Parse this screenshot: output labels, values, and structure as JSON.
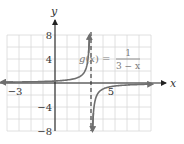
{
  "chart_data": {
    "type": "line",
    "title": "",
    "function_label": "g(x) = 1/(3 − x)",
    "equation": {
      "lhs": "g(x) =",
      "numerator": "1",
      "denominator": "3 − x"
    },
    "xlabel": "x",
    "ylabel": "y",
    "xlim": [
      -4,
      8
    ],
    "ylim": [
      -8,
      8
    ],
    "x_tick_labels": [
      {
        "value": -3,
        "label": "−3"
      },
      {
        "value": 5,
        "label": "5"
      }
    ],
    "y_tick_labels": [
      {
        "value": 8,
        "label": "8"
      },
      {
        "value": 4,
        "label": "4"
      },
      {
        "value": -4,
        "label": "−4"
      },
      {
        "value": -8,
        "label": "−8"
      }
    ],
    "grid": true,
    "grid_step": {
      "x": 1,
      "y": 2
    },
    "asymptote": {
      "type": "vertical",
      "x": 3,
      "style": "dashed"
    },
    "series": [
      {
        "name": "left branch",
        "x": [
          -4,
          -2,
          0,
          1,
          2,
          2.5,
          2.875
        ],
        "y": [
          0.14,
          0.2,
          0.33,
          0.5,
          1,
          2,
          8
        ]
      },
      {
        "name": "right branch",
        "x": [
          3.125,
          3.5,
          4,
          5,
          6,
          8
        ],
        "y": [
          -8,
          -2,
          -1,
          -0.5,
          -0.33,
          -0.2
        ]
      }
    ],
    "colors": {
      "curve": "#6e6e6e",
      "axis": "#222222",
      "grid": "#d8d8d8",
      "asymptote": "#333333"
    }
  }
}
